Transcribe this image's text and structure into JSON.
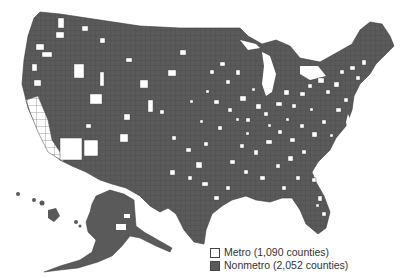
{
  "map": {
    "title": "",
    "subject": "U.S. counties by metropolitan status",
    "colors": {
      "metro": "#ffffff",
      "nonmetro": "#5a5a5a",
      "county_border": "#3a3a3a",
      "background": "#ffffff"
    },
    "regions_shown": [
      "Contiguous United States",
      "Alaska (inset)",
      "Hawaii (inset)"
    ]
  },
  "legend": {
    "items": [
      {
        "key": "metro",
        "label": "Metro (1,090 counties)",
        "color": "#ffffff"
      },
      {
        "key": "nonmetro",
        "label": "Nonmetro (2,052 counties)",
        "color": "#5a5a5a"
      }
    ]
  }
}
